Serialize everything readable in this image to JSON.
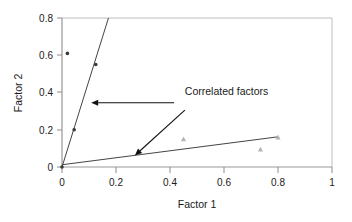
{
  "chart_data": {
    "type": "scatter",
    "title": "",
    "xlabel": "Factor 1",
    "ylabel": "Factor 2",
    "xlim": [
      0,
      1
    ],
    "ylim": [
      0,
      0.8
    ],
    "grid": false,
    "legend": "none",
    "xticks": [
      "0",
      "0.2",
      "0.4",
      "0.6",
      "0.8",
      "1"
    ],
    "xtick_values": [
      0,
      0.2,
      0.4,
      0.6,
      0.8,
      1
    ],
    "yticks": [
      "0",
      "0.2",
      "0.4",
      "0.6",
      "0.8"
    ],
    "ytick_values": [
      0,
      0.2,
      0.4,
      0.6,
      0.8
    ],
    "series": [
      {
        "name": "steep-factor-points",
        "marker": "dot",
        "color": "#3a3a3a",
        "points": [
          {
            "x": 0.0,
            "y": 0.0
          },
          {
            "x": 0.02,
            "y": 0.61
          },
          {
            "x": 0.045,
            "y": 0.2
          },
          {
            "x": 0.125,
            "y": 0.55
          }
        ]
      },
      {
        "name": "shallow-factor-points",
        "marker": "triangle",
        "color": "#b4b4b4",
        "points": [
          {
            "x": 0.45,
            "y": 0.15
          },
          {
            "x": 0.735,
            "y": 0.095
          },
          {
            "x": 0.8,
            "y": 0.16
          }
        ]
      }
    ],
    "trendlines": [
      {
        "name": "steep-trendline",
        "color": "#444444",
        "x0": 0.0,
        "y0": 0.0,
        "x1": 0.172,
        "y1": 0.8
      },
      {
        "name": "shallow-trendline",
        "color": "#444444",
        "x0": 0.0,
        "y0": 0.012,
        "x1": 0.8,
        "y1": 0.162
      }
    ],
    "annotations": [
      {
        "name": "correlated-factors-label",
        "text": "Correlated factors",
        "x": 0.455,
        "y": 0.385
      },
      {
        "name": "arrow-to-steep-line",
        "from_x": 0.415,
        "from_y": 0.345,
        "to_x": 0.108,
        "to_y": 0.345
      },
      {
        "name": "arrow-to-shallow-line",
        "from_x": 0.455,
        "from_y": 0.305,
        "to_x": 0.27,
        "to_y": 0.062
      }
    ]
  },
  "figure": {
    "axis_color": "#8c8c8c",
    "frame_color": "#b0b0b0",
    "background": "#ffffff"
  }
}
